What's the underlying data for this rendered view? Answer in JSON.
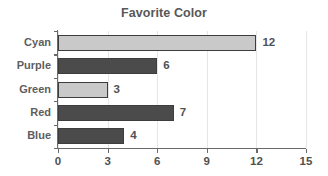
{
  "chart_data": {
    "type": "bar",
    "orientation": "horizontal",
    "title": "Favorite Color",
    "xlabel": "",
    "ylabel": "",
    "categories": [
      "Cyan",
      "Purple",
      "Green",
      "Red",
      "Blue"
    ],
    "values": [
      12,
      6,
      3,
      7,
      4
    ],
    "value_labels": [
      "12",
      "6",
      "3",
      "7",
      "4"
    ],
    "bar_colors": [
      "#c9c9c9",
      "#4b4b4b",
      "#c9c9c9",
      "#4b4b4b",
      "#4b4b4b"
    ],
    "bar_edge_color": "#3d3d3d",
    "xlim": [
      0,
      15
    ],
    "xticks": [
      0,
      3,
      6,
      9,
      12,
      15
    ],
    "xtick_labels": [
      "0",
      "3",
      "6",
      "9",
      "12",
      "15"
    ],
    "grid": true,
    "grid_axis": "x",
    "grid_color": "#e6e6e6",
    "legend": false,
    "background": "#ffffff",
    "title_color": "#575757",
    "tick_label_color": "#515151",
    "category_label_color": "#5e5e5e"
  }
}
